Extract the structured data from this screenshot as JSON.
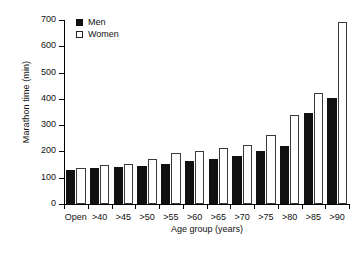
{
  "chart_data": {
    "type": "bar",
    "title": "",
    "xlabel": "Age group (years)",
    "ylabel": "Marathon time (min)",
    "categories": [
      "Open",
      ">40",
      ">45",
      ">50",
      ">55",
      ">60",
      ">65",
      ">70",
      ">75",
      ">80",
      ">85",
      ">90"
    ],
    "series": [
      {
        "name": "Men",
        "color": "#111111",
        "values": [
          128,
          136,
          139,
          145,
          153,
          165,
          173,
          181,
          200,
          222,
          345,
          403
        ]
      },
      {
        "name": "Women",
        "color": "#ffffff",
        "values": [
          138,
          148,
          153,
          173,
          193,
          203,
          212,
          225,
          262,
          340,
          422,
          692
        ]
      }
    ],
    "ylim": [
      0,
      700
    ],
    "yticks": [
      0,
      100,
      200,
      300,
      400,
      500,
      600,
      700
    ],
    "ytick_labels": [
      "0",
      "100",
      "200",
      "300",
      "400",
      "500",
      "600",
      "700"
    ],
    "grid": false,
    "legend_position": "top-left"
  },
  "legend": {
    "entries": [
      {
        "label": "Men",
        "swatch": "filled-square-marker"
      },
      {
        "label": "Women",
        "swatch": "open-square-marker"
      }
    ]
  }
}
